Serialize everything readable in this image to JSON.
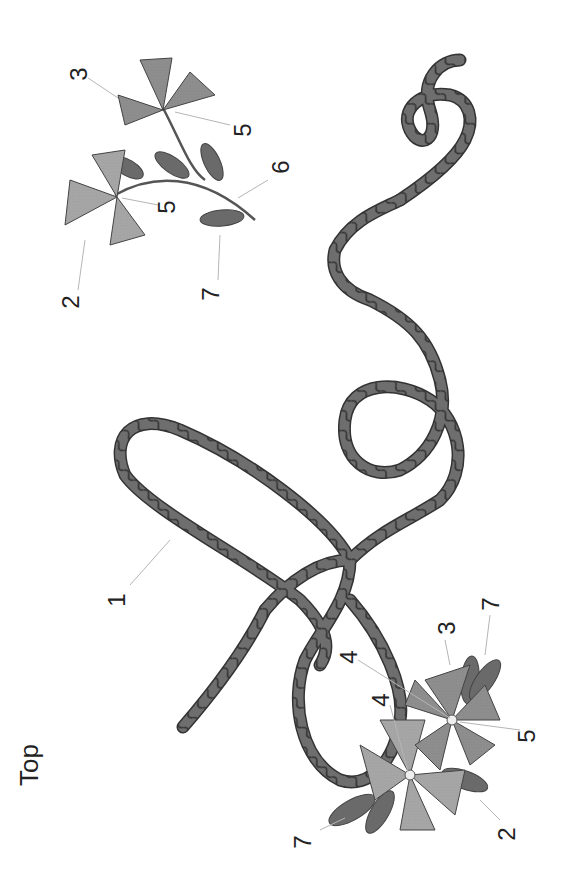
{
  "diagram": {
    "orientation_label": "Top",
    "colors": {
      "cord": "#6e6e6e",
      "cord_outline": "#3a3a3a",
      "petal_light": "#a9a9a9",
      "petal_mid": "#8f8f8f",
      "leaf_dark": "#6a6a6a",
      "stem": "#555555",
      "leader_line": "#b5b5b5",
      "background": "#ffffff"
    },
    "callouts": [
      {
        "id": "c1",
        "text": "1",
        "x": 118,
        "y": 600
      },
      {
        "id": "c2a",
        "text": "2",
        "x": 72,
        "y": 300
      },
      {
        "id": "c3a",
        "text": "3",
        "x": 78,
        "y": 72
      },
      {
        "id": "c5a",
        "text": "5",
        "x": 240,
        "y": 128
      },
      {
        "id": "c5b",
        "text": "5",
        "x": 167,
        "y": 205
      },
      {
        "id": "c6",
        "text": "6",
        "x": 280,
        "y": 165
      },
      {
        "id": "c7a",
        "text": "7",
        "x": 210,
        "y": 290
      },
      {
        "id": "c4a",
        "text": "4",
        "x": 380,
        "y": 715
      },
      {
        "id": "c4b",
        "text": "4",
        "x": 345,
        "y": 655
      },
      {
        "id": "c3b",
        "text": "3",
        "x": 445,
        "y": 622
      },
      {
        "id": "c7b",
        "text": "7",
        "x": 495,
        "y": 600
      },
      {
        "id": "c5c",
        "text": "5",
        "x": 530,
        "y": 730
      },
      {
        "id": "c2b",
        "text": "2",
        "x": 505,
        "y": 830
      },
      {
        "id": "c7c",
        "text": "7",
        "x": 305,
        "y": 838
      }
    ]
  }
}
